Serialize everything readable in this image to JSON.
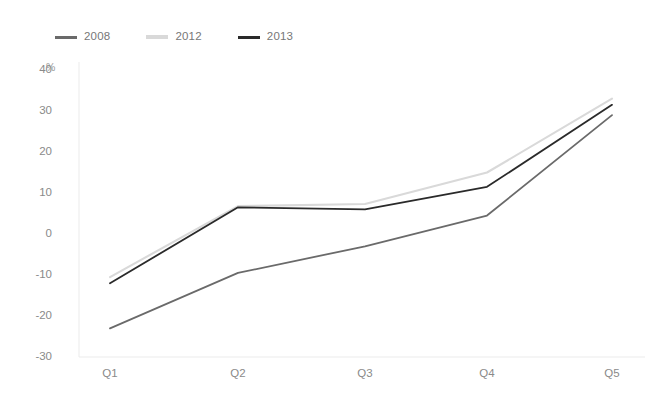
{
  "chart_data": {
    "type": "line",
    "title": "",
    "xlabel": "",
    "ylabel": "",
    "unit_label": "%",
    "categories": [
      "Q1",
      "Q2",
      "Q3",
      "Q4",
      "Q5"
    ],
    "ylim": [
      -30,
      40
    ],
    "yticks": [
      40,
      30,
      20,
      10,
      0,
      -10,
      -20,
      -30
    ],
    "ytick_labels": [
      "40",
      "30",
      "20",
      "10",
      "0",
      "-10",
      "-20",
      "-30"
    ],
    "grid": false,
    "legend_position": "top-left",
    "series": [
      {
        "name": "2008",
        "color": "#6a6a6a",
        "values": [
          -23.0,
          -9.5,
          -3.0,
          4.5,
          29.0
        ]
      },
      {
        "name": "2012",
        "color": "#d9d9d9",
        "values": [
          -10.5,
          6.8,
          7.3,
          15.0,
          33.0
        ]
      },
      {
        "name": "2013",
        "color": "#2a2a2a",
        "values": [
          -12.0,
          6.5,
          6.0,
          11.5,
          31.5
        ]
      }
    ]
  },
  "axis": {
    "line_color": "#ebebeb",
    "tick_text_color": "#8a8a8a"
  }
}
